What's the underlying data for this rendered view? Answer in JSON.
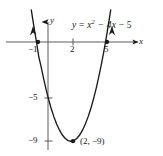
{
  "figure": {
    "kind": "coordinate-plane-parabola",
    "background_color": "#ffffff",
    "ink_color": "#1a1a1a",
    "top_artifact_text": "",
    "axes": {
      "x_axis_label": "x",
      "y_axis_label": "y",
      "x_axis_pixel_y": 42,
      "y_axis_pixel_x": 48
    },
    "equation_label": {
      "full_text": "y = x² − 4x − 5",
      "lhs": "y",
      "equals": "=",
      "term1_base": "x",
      "term1_exp": "2",
      "term2": "− 4x",
      "term3": "− 5"
    },
    "tick_labels": {
      "x": [
        {
          "text": "−1",
          "value": -1
        },
        {
          "text": "2",
          "value": 2
        },
        {
          "text": "5",
          "value": 5
        }
      ],
      "y": [
        {
          "text": "−5",
          "value": -5
        },
        {
          "text": "−9",
          "value": -9
        }
      ]
    },
    "vertex_label": "(2, −9)",
    "points": [
      {
        "name": "root-left",
        "label": "−1",
        "x": -1,
        "y": 0
      },
      {
        "name": "root-right",
        "label": "5",
        "x": 5,
        "y": 0
      },
      {
        "name": "vertex",
        "label": "(2, −9)",
        "x": 2,
        "y": -9
      }
    ]
  },
  "chart_data": {
    "type": "line",
    "title": "",
    "subtitle": "",
    "xlabel": "x",
    "ylabel": "y",
    "grid": false,
    "legend_position": "none",
    "xlim": [
      -1.9,
      6.6
    ],
    "ylim": [
      -10.6,
      1.6
    ],
    "xticks": [
      -1,
      2,
      5
    ],
    "xticklabels": [
      "−1",
      "2",
      "5"
    ],
    "yticks": [
      -5,
      -9
    ],
    "yticklabels": [
      "−5",
      "−9"
    ],
    "annotations": [
      {
        "text": "y = x² − 4x − 5",
        "x": 3.1,
        "y": 1.1
      },
      {
        "text": "(2, −9)",
        "x": 3.0,
        "y": -9.6
      }
    ],
    "series": [
      {
        "name": "y = x^2 - 4x - 5",
        "equation": "y = x^2 - 4x - 5",
        "color": "#1a1a1a",
        "vertex": [
          2,
          -9
        ],
        "roots": [
          -1,
          5
        ],
        "y_intercept": -5,
        "x": [
          -1.45,
          -1.3,
          -1.15,
          -1.0,
          -0.8,
          -0.6,
          -0.4,
          -0.2,
          0.0,
          0.25,
          0.5,
          0.75,
          1.0,
          1.25,
          1.5,
          1.75,
          2.0,
          2.25,
          2.5,
          2.75,
          3.0,
          3.25,
          3.5,
          3.75,
          4.0,
          4.2,
          4.4,
          4.6,
          4.8,
          5.0,
          5.15,
          5.3,
          5.45
        ],
        "y": [
          2.9,
          1.89,
          0.92,
          0.0,
          -1.36,
          -2.24,
          -3.24,
          -4.16,
          -5.0,
          -5.94,
          -6.75,
          -7.44,
          -8.0,
          -8.44,
          -8.75,
          -8.94,
          -9.0,
          -8.94,
          -8.75,
          -8.44,
          -8.0,
          -7.44,
          -6.75,
          -5.94,
          -5.0,
          -4.16,
          -3.24,
          -2.24,
          -1.16,
          0.0,
          0.92,
          1.89,
          2.9
        ]
      }
    ],
    "markers": [
      {
        "x": -1,
        "y": 0,
        "style": "filled-dot"
      },
      {
        "x": 5,
        "y": 0,
        "style": "filled-dot"
      },
      {
        "x": 2,
        "y": -9,
        "style": "filled-dot"
      }
    ],
    "arrows": [
      {
        "at": "curve-left-end",
        "direction": "up"
      },
      {
        "at": "curve-right-end",
        "direction": "up"
      },
      {
        "at": "x-axis-right-end",
        "direction": "right"
      },
      {
        "at": "y-axis-top-end",
        "direction": "up"
      }
    ]
  }
}
